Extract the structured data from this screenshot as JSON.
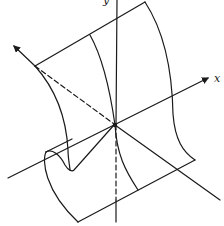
{
  "figure": {
    "type": "3d-surface-line-drawing",
    "axes": {
      "x_label": "x",
      "y_label": "y"
    },
    "stroke_color": "#1a1a1a",
    "background": "#ffffff"
  }
}
